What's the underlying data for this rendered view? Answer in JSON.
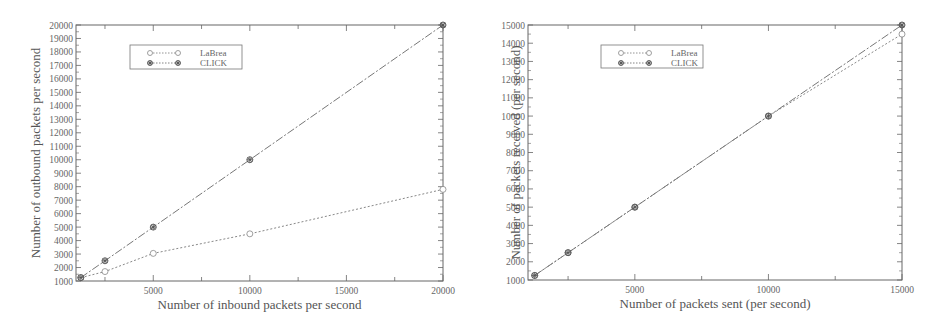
{
  "chart_data": [
    {
      "type": "line",
      "title": "",
      "xlabel": "Number of inbound packets per second",
      "ylabel": "Number of outbound packets per second",
      "xlim": [
        1000,
        20000
      ],
      "ylim": [
        1000,
        20000
      ],
      "x_ticks": [
        5000,
        10000,
        15000,
        20000
      ],
      "y_ticks": [
        1000,
        2000,
        3000,
        4000,
        5000,
        6000,
        7000,
        8000,
        9000,
        10000,
        11000,
        12000,
        13000,
        14000,
        15000,
        16000,
        17000,
        18000,
        19000,
        20000
      ],
      "grid": false,
      "legend_position": "upper-left",
      "series": [
        {
          "name": "LaBrea",
          "marker": "circle",
          "x": [
            1250,
            2500,
            5000,
            10000,
            20000
          ],
          "values": [
            1250,
            1700,
            3050,
            4500,
            7800
          ]
        },
        {
          "name": "CLICK",
          "marker": "star",
          "x": [
            1250,
            2500,
            5000,
            10000,
            20000
          ],
          "values": [
            1250,
            2500,
            5000,
            10000,
            20000
          ]
        }
      ]
    },
    {
      "type": "line",
      "title": "",
      "xlabel": "Number of packets sent (per second)",
      "ylabel": "Number of packets received (per second)",
      "xlim": [
        1000,
        15000
      ],
      "ylim": [
        1000,
        15000
      ],
      "x_ticks": [
        5000,
        10000,
        15000
      ],
      "y_ticks": [
        1000,
        2000,
        3000,
        4000,
        5000,
        6000,
        7000,
        8000,
        9000,
        10000,
        11000,
        12000,
        13000,
        14000,
        15000
      ],
      "grid": false,
      "legend_position": "upper-left",
      "series": [
        {
          "name": "LaBrea",
          "marker": "circle",
          "x": [
            1250,
            2500,
            5000,
            10000,
            15000
          ],
          "values": [
            1250,
            2500,
            5000,
            10000,
            14500
          ]
        },
        {
          "name": "CLICK",
          "marker": "star",
          "x": [
            1250,
            2500,
            5000,
            10000,
            15000
          ],
          "values": [
            1250,
            2500,
            5000,
            10000,
            15000
          ]
        }
      ]
    }
  ],
  "charts": [
    {
      "xlabel": "Number of inbound packets per second",
      "ylabel": "Number of outbound packets per second",
      "legend": [
        "LaBrea",
        "CLICK"
      ]
    },
    {
      "xlabel": "Number of packets sent (per second)",
      "ylabel": "Number of packets received (per second)",
      "legend": [
        "LaBrea",
        "CLICK"
      ]
    }
  ]
}
